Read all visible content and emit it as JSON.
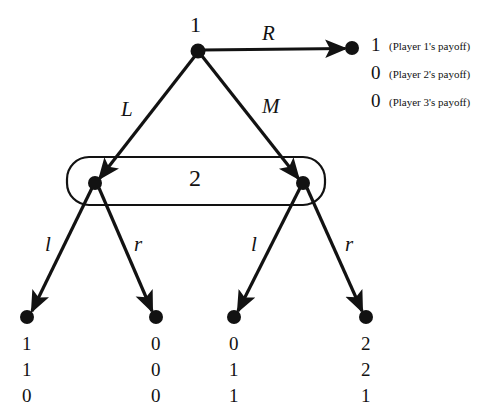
{
  "diagram": {
    "type": "extensive-form-game-tree",
    "title_visible": false,
    "colors": {
      "ink": "#121212",
      "background": "#ffffff"
    },
    "nodes": {
      "root": {
        "label": "1",
        "x": 198,
        "y": 51
      },
      "p2_left": {
        "label": "",
        "x": 95,
        "y": 183
      },
      "p2_right": {
        "label": "",
        "x": 303,
        "y": 183
      },
      "terminal_R": {
        "x": 352,
        "y": 48
      },
      "terminal_Ll": {
        "x": 27,
        "y": 317
      },
      "terminal_Lr": {
        "x": 156,
        "y": 317
      },
      "terminal_Ml": {
        "x": 234,
        "y": 317
      },
      "terminal_Mr": {
        "x": 366,
        "y": 317
      }
    },
    "information_set": {
      "label": "2",
      "label_x": 197,
      "label_y": 178,
      "x": 67,
      "y": 157,
      "width": 258,
      "height": 48
    },
    "actions": {
      "root_right": {
        "label": "R",
        "x": 268,
        "y": 34
      },
      "root_left": {
        "label": "L",
        "x": 127,
        "y": 110
      },
      "root_middle": {
        "label": "M",
        "x": 270,
        "y": 107
      },
      "left_l": {
        "label": "l",
        "x": 48,
        "y": 245
      },
      "left_r": {
        "label": "r",
        "x": 137,
        "y": 245
      },
      "right_l": {
        "label": "l",
        "x": 254,
        "y": 245
      },
      "right_r": {
        "label": "r",
        "x": 348,
        "y": 245
      }
    },
    "payoffs": {
      "R": {
        "values": [
          "1",
          "0",
          "0"
        ],
        "notes": [
          "(Player 1's payoff)",
          "(Player 2's payoff)",
          "(Player 3's payoff)"
        ],
        "x": 371,
        "y": 36
      },
      "Ll": {
        "values": [
          "1",
          "1",
          "0"
        ],
        "x": 22,
        "y": 331
      },
      "Lr": {
        "values": [
          "0",
          "0",
          "0"
        ],
        "x": 151,
        "y": 331
      },
      "Ml": {
        "values": [
          "0",
          "1",
          "1"
        ],
        "x": 229,
        "y": 331
      },
      "Mr": {
        "values": [
          "2",
          "2",
          "1"
        ],
        "x": 361,
        "y": 331
      }
    }
  }
}
